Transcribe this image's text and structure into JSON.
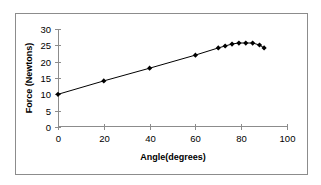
{
  "chart_data": {
    "type": "line",
    "title": "",
    "xlabel": "Angle(degrees)",
    "ylabel": "Force (Newtons)",
    "xlim": [
      0,
      100
    ],
    "ylim": [
      0,
      30
    ],
    "xticks": [
      0,
      20,
      40,
      60,
      80,
      100
    ],
    "yticks": [
      0,
      5,
      10,
      15,
      20,
      25,
      30
    ],
    "grid": false,
    "legend": null,
    "series": [
      {
        "name": "Force",
        "marker": "diamond",
        "color": "#000000",
        "x": [
          0,
          20,
          40,
          60,
          70,
          73,
          76,
          79,
          82,
          85,
          88,
          90
        ],
        "y": [
          10,
          14.1,
          18,
          22,
          24.2,
          24.8,
          25.4,
          25.7,
          25.7,
          25.7,
          25.1,
          24.2
        ]
      }
    ]
  }
}
